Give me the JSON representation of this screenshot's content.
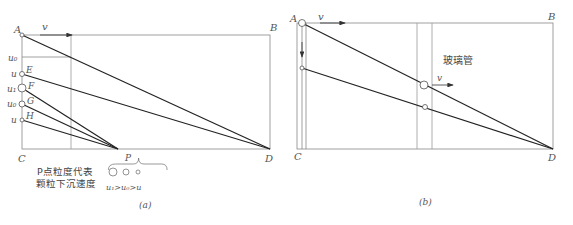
{
  "figure_a": {
    "caption": "(a)",
    "points": {
      "A": "A",
      "B": "B",
      "C": "C",
      "D": "D",
      "E": "E",
      "F": "F",
      "G": "G",
      "H": "H",
      "P": "P"
    },
    "velocity_label": "v",
    "left_labels": {
      "u0": "u₀",
      "u_e": "u",
      "u1": "u₁",
      "u0_g": "u₀",
      "u_h": "u"
    },
    "note_line1": "P点粒度代表",
    "note_line2": "颗粒下沉速度",
    "p_label": "P",
    "inequality": "u₁>u₀>u"
  },
  "figure_b": {
    "caption": "(b)",
    "points": {
      "A": "A",
      "B": "B",
      "C": "C",
      "D": "D"
    },
    "velocity_label_top": "v",
    "velocity_label_tube": "v",
    "tube_label": "玻璃管"
  }
}
